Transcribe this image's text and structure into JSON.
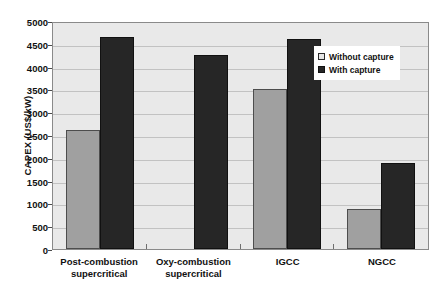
{
  "chart_data": {
    "type": "bar",
    "title": "",
    "xlabel": "",
    "ylabel": "CAPEX (US$/kW)",
    "ylim": [
      0,
      5000
    ],
    "ytick_step": 500,
    "yticks": [
      5000,
      4500,
      4000,
      3500,
      3000,
      2500,
      2000,
      1500,
      1000,
      500,
      0
    ],
    "ytick_labels": [
      "5000",
      "4500",
      "4000",
      "3500",
      "3000",
      "2500",
      "2000",
      "1500",
      "1000",
      "500",
      "0"
    ],
    "grid": true,
    "legend_position": "upper right",
    "categories": [
      "Post-combustion supercritical",
      "Oxy-combustion supercritical",
      "IGCC",
      "NGCC"
    ],
    "category_lines": [
      [
        "Post-combustion",
        "supercritical"
      ],
      [
        "Oxy-combustion",
        "supercritical"
      ],
      [
        "IGCC",
        ""
      ],
      [
        "NGCC",
        ""
      ]
    ],
    "series": [
      {
        "name": "Without capture",
        "color": "#a0a0a0",
        "values": [
          2600,
          null,
          3500,
          880
        ]
      },
      {
        "name": "With capture",
        "color": "#262626",
        "values": [
          4650,
          4250,
          4600,
          1880
        ]
      }
    ]
  },
  "legend": {
    "items": [
      {
        "label": "Without capture",
        "swatch": "without"
      },
      {
        "label": "With capture",
        "swatch": "with"
      }
    ]
  },
  "axis": {
    "y_title": "CAPEX (US$/kW)"
  }
}
